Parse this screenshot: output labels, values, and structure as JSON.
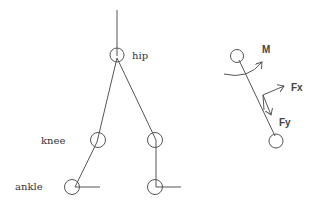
{
  "diagram": {
    "left_figure": {
      "description": "leg skeleton model",
      "labels": {
        "hip": "hip",
        "knee": "knee",
        "ankle": "ankle"
      }
    },
    "right_figure": {
      "description": "segment free-body diagram",
      "labels": {
        "moment": "M",
        "force_x": "Fx",
        "force_y": "Fy"
      }
    },
    "colors": {
      "line": "#555555",
      "text": "#333333",
      "background": "#ffffff"
    }
  }
}
